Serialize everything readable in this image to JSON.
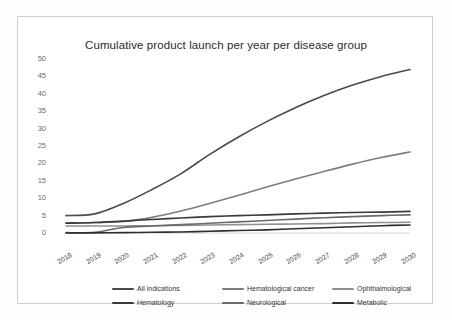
{
  "figure": {
    "title": "Cumulative product launch per year per disease group"
  },
  "chart_data": {
    "type": "line",
    "title": "Cumulative product launch per year per disease group",
    "xlabel": "",
    "ylabel": "",
    "x": [
      2018,
      2019,
      2020,
      2021,
      2022,
      2023,
      2024,
      2025,
      2026,
      2027,
      2028,
      2029,
      2030
    ],
    "categories": [
      "2018",
      "2019",
      "2020",
      "2021",
      "2022",
      "2023",
      "2024",
      "2025",
      "2026",
      "2027",
      "2028",
      "2029",
      "2030"
    ],
    "xlim": [
      2018,
      2030
    ],
    "ylim": [
      0,
      50
    ],
    "yticks": [
      0,
      5,
      10,
      15,
      20,
      25,
      30,
      35,
      40,
      45,
      50
    ],
    "grid": false,
    "legend_position": "bottom",
    "series": [
      {
        "name": "All indications",
        "color": "#4a4a4a",
        "values": [
          5.0,
          5.5,
          8.5,
          12.5,
          17.0,
          22.5,
          27.5,
          32.0,
          36.0,
          39.5,
          42.5,
          45.0,
          47.0
        ]
      },
      {
        "name": "Hematological cancer",
        "color": "#7d7d7d",
        "values": [
          2.9,
          3.0,
          3.3,
          4.5,
          6.3,
          8.5,
          10.8,
          13.2,
          15.5,
          17.7,
          19.8,
          21.7,
          23.3
        ]
      },
      {
        "name": "Ophthalmological",
        "color": "#909090",
        "values": [
          2.0,
          2.0,
          2.0,
          2.1,
          2.2,
          2.3,
          2.4,
          2.5,
          2.6,
          2.7,
          2.9,
          3.0,
          3.1
        ]
      },
      {
        "name": "Hematology",
        "color": "#3a3a3a",
        "values": [
          2.8,
          3.0,
          3.4,
          3.9,
          4.3,
          4.7,
          5.0,
          5.2,
          5.5,
          5.7,
          5.9,
          6.0,
          6.2
        ]
      },
      {
        "name": "Neurological",
        "color": "#6a6a6a",
        "values": [
          0.1,
          0.2,
          1.6,
          2.0,
          2.4,
          2.8,
          3.2,
          3.6,
          4.0,
          4.4,
          4.7,
          5.0,
          5.2
        ]
      },
      {
        "name": "Metabolic",
        "color": "#2e2e2e",
        "values": [
          0.0,
          0.05,
          0.1,
          0.2,
          0.3,
          0.5,
          0.7,
          0.9,
          1.2,
          1.5,
          1.8,
          2.1,
          2.3
        ]
      }
    ]
  },
  "legend": {
    "rows": [
      [
        {
          "label": "All indications",
          "color": "#4a4a4a"
        },
        {
          "label": "Hematological cancer",
          "color": "#7d7d7d"
        },
        {
          "label": "Ophthalmological",
          "color": "#909090"
        }
      ],
      [
        {
          "label": "Hematology",
          "color": "#3a3a3a"
        },
        {
          "label": "Neurological",
          "color": "#6a6a6a"
        },
        {
          "label": "Metabolic",
          "color": "#2e2e2e"
        }
      ]
    ]
  }
}
